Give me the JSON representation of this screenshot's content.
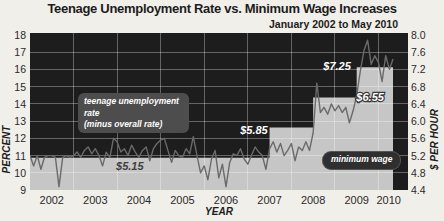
{
  "header": {
    "title": "Teenage Unemployment Rate vs. Minimum Wage Increases",
    "subtitle": "January 2002 to May 2010"
  },
  "colors": {
    "page_bg": "#f1efe9",
    "plot_bg": "#1d1d1d",
    "wage_area": "#c6c6c6",
    "gridline": "rgba(255,255,255,0.32)",
    "unemployment_line": "#6a6a6a",
    "series_badge_bg": "#4d4d4d",
    "wage_badge_bg": "#2f2f2f",
    "annotation_light": "#ffffff",
    "annotation_dark": "#3f3f3f"
  },
  "chart_data": {
    "type": "line",
    "title": "Teenage Unemployment Rate vs. Minimum Wage Increases",
    "subtitle": "January 2002 to May 2010",
    "xlabel": "YEAR",
    "ylabel_left": "PERCENT",
    "ylabel_right": "$ PER HOUR",
    "x_start": "2002-01",
    "x_end": "2010-05",
    "x_interval": "monthly",
    "x_tick_labels": [
      "2002",
      "2003",
      "2004",
      "2005",
      "2006",
      "2007",
      "2008",
      "2009",
      "2010"
    ],
    "y_left_range": [
      9,
      18
    ],
    "y_left_ticks": [
      "18",
      "17",
      "16",
      "15",
      "14",
      "13",
      "12",
      "11",
      "10",
      "9"
    ],
    "y_right_range": [
      4.4,
      8.0
    ],
    "y_right_ticks": [
      "8.0",
      "7.6",
      "7.2",
      "6.8",
      "6.4",
      "6.0",
      "5.6",
      "5.2",
      "4.8",
      "4.4"
    ],
    "grid": true,
    "series": [
      {
        "name": "teenage unemployment rate (minus overall rate)",
        "axis": "left",
        "unit": "percent",
        "monthly_values": [
          11.0,
          10.4,
          11.0,
          10.2,
          10.9,
          11.0,
          11.0,
          10.9,
          9.2,
          10.9,
          11.0,
          10.9,
          11.0,
          11.2,
          10.9,
          11.3,
          11.5,
          11.1,
          11.4,
          11.0,
          10.4,
          11.2,
          10.9,
          12.0,
          11.8,
          11.2,
          11.4,
          11.0,
          11.6,
          11.2,
          10.9,
          11.3,
          11.5,
          10.7,
          11.4,
          11.7,
          11.9,
          12.0,
          11.3,
          10.6,
          11.3,
          11.0,
          10.9,
          11.4,
          11.1,
          12.1,
          11.0,
          10.0,
          10.4,
          9.6,
          10.8,
          11.3,
          9.7,
          10.5,
          9.2,
          10.6,
          11.1,
          11.0,
          11.4,
          10.8,
          10.5,
          11.0,
          11.5,
          11.2,
          11.0,
          10.2,
          11.4,
          11.8,
          11.2,
          11.7,
          11.0,
          11.3,
          11.7,
          10.7,
          11.5,
          11.3,
          11.8,
          11.3,
          12.3,
          15.2,
          13.5,
          13.8,
          13.4,
          14.0,
          13.6,
          13.9,
          13.5,
          13.8,
          12.9,
          13.6,
          14.5,
          15.9,
          17.1,
          17.7,
          16.3,
          16.8,
          16.4,
          15.3,
          16.8,
          16.0,
          16.6
        ]
      },
      {
        "name": "minimum wage",
        "axis": "right",
        "unit": "dollars per hour",
        "style": "step-area",
        "steps": [
          {
            "start": "2002-01",
            "value": 5.15
          },
          {
            "start": "2007-07",
            "value": 5.85
          },
          {
            "start": "2008-07",
            "value": 6.55
          },
          {
            "start": "2009-07",
            "value": 7.25
          }
        ]
      }
    ],
    "annotations": [
      {
        "label": "$5.15",
        "x_month": 27.5,
        "y_value": 10.4,
        "tone": "dark"
      },
      {
        "label": "$5.85",
        "x_month": 61.7,
        "y_value": 12.5,
        "tone": "light"
      },
      {
        "label": "$6.55",
        "x_month": 93.7,
        "y_value": 14.4,
        "tone": "light",
        "outline": true
      },
      {
        "label": "$7.25",
        "x_month": 84.6,
        "y_value": 16.2,
        "tone": "light"
      }
    ],
    "legend": {
      "series_badge_line1": "teenage unemployment rate",
      "series_badge_line2": "(minus overall rate)",
      "wage_badge": "minimum wage"
    }
  }
}
